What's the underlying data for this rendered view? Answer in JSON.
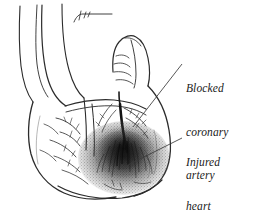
{
  "figure": {
    "name": "heart-attack-illustration",
    "background_color": "#ffffff",
    "ink_color": "#2b2b2b",
    "shading_color": "#1c1c1c"
  },
  "labels": [
    {
      "id": "blocked-artery",
      "lines": [
        "Blocked",
        "coronary",
        "artery"
      ],
      "leader_from": [
        182,
        64
      ],
      "leader_to": [
        133,
        127
      ]
    },
    {
      "id": "injured-muscle",
      "lines": [
        "Injured",
        "heart",
        "muscle"
      ],
      "leader_from": [
        182,
        138
      ],
      "leader_to": [
        124,
        167
      ]
    }
  ],
  "anatomy": {
    "parts": [
      "aorta",
      "pulmonary-trunk",
      "atrial-appendage",
      "left-ventricle",
      "right-ventricle",
      "coronary-arteries",
      "apex",
      "infarct-zone"
    ]
  }
}
